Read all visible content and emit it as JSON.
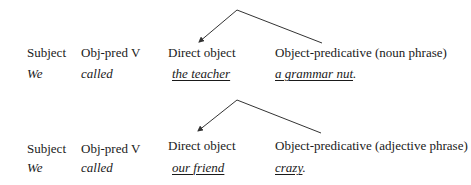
{
  "diagrams": [
    {
      "labels": [
        "Subject",
        "Obj-pred V",
        "Direct object",
        "Object-predicative (noun phrase)"
      ],
      "values": [
        "We",
        "called",
        "the teacher",
        "a grammar nut"
      ],
      "trailing_punct": ".",
      "arrow": {
        "apex": [
          237,
          10
        ],
        "left_end": [
          199,
          42
        ],
        "right_end": [
          322,
          43
        ]
      }
    },
    {
      "labels": [
        "Subject",
        "Obj-pred V",
        "Direct object",
        "Object-predicative (adjective phrase)"
      ],
      "values": [
        "We",
        "called",
        "our friend",
        "crazy"
      ],
      "trailing_punct": ".",
      "arrow": {
        "apex": [
          237,
          10
        ],
        "left_end": [
          198,
          41
        ],
        "right_end": [
          321,
          43
        ]
      }
    }
  ],
  "colors": {
    "line": "#333333",
    "text": "#1a1a1a"
  }
}
